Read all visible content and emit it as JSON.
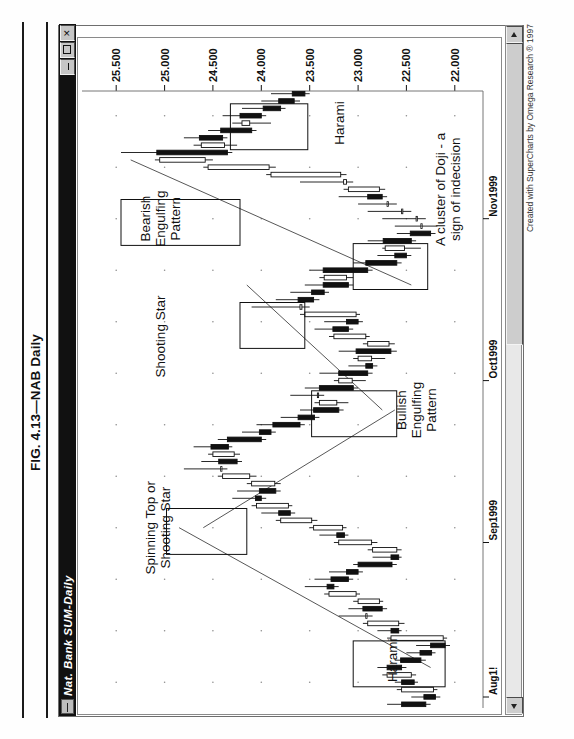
{
  "figure": {
    "caption": "FIG. 4.13—NAB Daily"
  },
  "window": {
    "title": "Nat. Bank  SUM-Daily",
    "icon": "chart-window-icon",
    "buttons": [
      {
        "name": "minimize-button",
        "glyph": "_"
      },
      {
        "name": "maximize-button",
        "glyph": "□"
      },
      {
        "name": "close-button",
        "glyph": "X"
      }
    ],
    "credit": "Created with SuperCharts by Omega Research ® 1997"
  },
  "scrollbar": {
    "left_arrow": "◀",
    "right_arrow": "▶",
    "thumb_label": ""
  },
  "chart_data": {
    "type": "candlestick",
    "title": "Nat. Bank  SUM-Daily",
    "xlabel": "",
    "ylabel": "",
    "grid": true,
    "legend": "none",
    "ylim": [
      21.75,
      25.75
    ],
    "price_ticks": [
      "25.500",
      "25.000",
      "24.500",
      "24.000",
      "23.500",
      "23.000",
      "22.500",
      "22.000"
    ],
    "price_tick_values": [
      25.5,
      25.0,
      24.5,
      24.0,
      23.5,
      23.0,
      22.5,
      22.0
    ],
    "date_ticks": [
      "Aug1!",
      "Sep1999",
      "Oct1999",
      "Nov1999"
    ],
    "date_tick_index": [
      1,
      22,
      44,
      66
    ],
    "n_bars": 84,
    "columns": [
      "open",
      "high",
      "low",
      "close"
    ],
    "bars": [
      [
        22.55,
        22.7,
        22.25,
        22.3
      ],
      [
        22.32,
        22.45,
        22.15,
        22.2
      ],
      [
        22.22,
        22.6,
        22.18,
        22.55
      ],
      [
        22.55,
        22.62,
        22.38,
        22.42
      ],
      [
        22.45,
        22.75,
        22.4,
        22.7
      ],
      [
        22.7,
        22.8,
        22.5,
        22.55
      ],
      [
        22.56,
        22.62,
        22.3,
        22.35
      ],
      [
        22.36,
        22.5,
        22.2,
        22.24
      ],
      [
        22.25,
        22.4,
        22.05,
        22.1
      ],
      [
        22.12,
        22.7,
        22.08,
        22.66
      ],
      [
        22.66,
        22.8,
        22.55,
        22.58
      ],
      [
        22.58,
        22.95,
        22.52,
        22.9
      ],
      [
        22.92,
        23.2,
        22.85,
        22.92
      ],
      [
        22.95,
        23.1,
        22.7,
        22.75
      ],
      [
        22.78,
        23.05,
        22.74,
        23.0
      ],
      [
        23.02,
        23.35,
        22.98,
        23.3
      ],
      [
        23.32,
        23.55,
        23.2,
        23.25
      ],
      [
        23.28,
        23.45,
        23.05,
        23.1
      ],
      [
        23.12,
        23.3,
        22.95,
        23.0
      ],
      [
        23.0,
        23.05,
        22.6,
        22.65
      ],
      [
        22.66,
        22.85,
        22.55,
        22.58
      ],
      [
        22.6,
        22.9,
        22.55,
        22.85
      ],
      [
        22.86,
        23.25,
        22.8,
        23.2
      ],
      [
        23.22,
        23.4,
        23.1,
        23.14
      ],
      [
        23.16,
        23.5,
        23.12,
        23.46
      ],
      [
        23.48,
        23.85,
        23.42,
        23.8
      ],
      [
        23.82,
        24.0,
        23.65,
        23.7
      ],
      [
        23.72,
        24.1,
        23.68,
        24.05
      ],
      [
        24.06,
        24.3,
        23.95,
        24.0
      ],
      [
        24.02,
        24.25,
        23.8,
        23.85
      ],
      [
        23.86,
        24.15,
        23.8,
        24.1
      ],
      [
        24.12,
        24.45,
        24.05,
        24.4
      ],
      [
        24.42,
        24.8,
        24.35,
        24.42
      ],
      [
        24.44,
        24.62,
        24.2,
        24.25
      ],
      [
        24.28,
        24.55,
        24.22,
        24.5
      ],
      [
        24.52,
        24.7,
        24.3,
        24.34
      ],
      [
        24.35,
        24.45,
        23.95,
        24.0
      ],
      [
        24.02,
        24.2,
        23.85,
        23.9
      ],
      [
        23.88,
        24.05,
        23.55,
        23.6
      ],
      [
        23.62,
        23.8,
        23.4,
        23.45
      ],
      [
        23.46,
        23.6,
        23.15,
        23.2
      ],
      [
        23.22,
        23.45,
        23.1,
        23.4
      ],
      [
        23.42,
        23.7,
        23.35,
        23.42
      ],
      [
        23.4,
        23.55,
        23.0,
        23.05
      ],
      [
        23.06,
        23.25,
        22.92,
        23.2
      ],
      [
        23.2,
        23.4,
        22.85,
        22.9
      ],
      [
        22.92,
        23.1,
        22.8,
        22.85
      ],
      [
        22.86,
        23.05,
        22.72,
        23.0
      ],
      [
        23.02,
        23.2,
        22.6,
        22.66
      ],
      [
        22.68,
        22.95,
        22.62,
        22.9
      ],
      [
        22.92,
        23.3,
        22.88,
        23.25
      ],
      [
        23.26,
        23.45,
        23.05,
        23.1
      ],
      [
        23.12,
        23.35,
        22.95,
        23.0
      ],
      [
        23.02,
        23.6,
        22.98,
        23.55
      ],
      [
        23.58,
        24.1,
        23.5,
        23.6
      ],
      [
        23.62,
        23.85,
        23.4,
        23.46
      ],
      [
        23.48,
        23.7,
        23.3,
        23.35
      ],
      [
        23.36,
        23.55,
        23.05,
        23.1
      ],
      [
        23.12,
        23.4,
        23.05,
        23.35
      ],
      [
        23.36,
        23.5,
        22.85,
        22.9
      ],
      [
        22.92,
        23.05,
        22.55,
        22.6
      ],
      [
        22.62,
        22.8,
        22.45,
        22.5
      ],
      [
        22.52,
        22.75,
        22.35,
        22.72
      ],
      [
        22.74,
        22.9,
        22.4,
        22.45
      ],
      [
        22.46,
        22.6,
        22.2,
        22.25
      ],
      [
        22.35,
        22.62,
        22.18,
        22.35
      ],
      [
        22.4,
        22.75,
        22.3,
        22.4
      ],
      [
        22.55,
        22.9,
        22.45,
        22.55
      ],
      [
        22.7,
        23.0,
        22.6,
        22.7
      ],
      [
        22.9,
        23.2,
        22.7,
        22.75
      ],
      [
        22.78,
        23.15,
        22.72,
        23.1
      ],
      [
        23.12,
        23.6,
        23.05,
        23.15
      ],
      [
        23.18,
        23.95,
        23.12,
        23.9
      ],
      [
        23.92,
        24.6,
        23.85,
        24.55
      ],
      [
        24.58,
        25.1,
        24.5,
        25.05
      ],
      [
        25.08,
        25.45,
        24.3,
        24.35
      ],
      [
        24.38,
        24.7,
        24.25,
        24.62
      ],
      [
        24.64,
        24.8,
        24.35,
        24.4
      ],
      [
        24.42,
        24.55,
        24.05,
        24.1
      ],
      [
        24.12,
        24.3,
        23.9,
        24.2
      ],
      [
        24.22,
        24.4,
        23.95,
        24.0
      ],
      [
        23.98,
        24.2,
        23.75,
        23.8
      ],
      [
        23.82,
        24.0,
        23.6,
        23.66
      ],
      [
        23.68,
        23.9,
        23.5,
        23.55
      ]
    ],
    "annotations": [
      {
        "name": "harami-left",
        "text": "Harami",
        "x_bar": 6,
        "y_price": 22.6
      },
      {
        "name": "spinning-top-or-shooting-star",
        "text": "Spinning Top or\nShooting Star",
        "x_bar": 24,
        "y_price": 25.1
      },
      {
        "name": "bullish-engulfing-pattern",
        "text": "Bullish\nEngulfing\nPattern",
        "x_bar": 40,
        "y_price": 22.5
      },
      {
        "name": "shooting-star",
        "text": "Shooting Star",
        "x_bar": 50,
        "y_price": 25.0
      },
      {
        "name": "bearish-engulfing-pattern",
        "text": "Bearish\nEngulfing\nPattern",
        "x_bar": 66,
        "y_price": 25.15
      },
      {
        "name": "doji-cluster",
        "text": "A cluster of Doji - a\nsign of indecision",
        "x_bar": 70,
        "y_price": 22.1
      },
      {
        "name": "harami-right",
        "text": "Harami",
        "x_bar": 79,
        "y_price": 23.15
      }
    ],
    "highlight_boxes": [
      {
        "name": "harami-left-box",
        "x0": 3,
        "x1": 8,
        "y0": 22.1,
        "y1": 23.05
      },
      {
        "name": "spinning-top-box",
        "x0": 21,
        "x1": 26,
        "y0": 24.15,
        "y1": 24.98
      },
      {
        "name": "bullish-engulfing-box",
        "x0": 37,
        "x1": 42,
        "y0": 22.6,
        "y1": 23.48
      },
      {
        "name": "shooting-star-box",
        "x0": 49,
        "x1": 54,
        "y0": 23.55,
        "y1": 24.22
      },
      {
        "name": "bearish-engulfing-box",
        "x0": 63,
        "x1": 68,
        "y0": 24.22,
        "y1": 25.45
      },
      {
        "name": "doji-cluster-box",
        "x0": 57,
        "x1": 62,
        "y0": 22.28,
        "y1": 23.05
      },
      {
        "name": "harami-right-box",
        "x0": 76,
        "x1": 81,
        "y0": 23.52,
        "y1": 24.32
      }
    ],
    "trendlines": [
      {
        "name": "trendline-1",
        "x0": 5,
        "y0": 22.25,
        "x1": 24,
        "y1": 24.85
      },
      {
        "name": "trendline-2",
        "x0": 24,
        "y0": 24.6,
        "x1": 40,
        "y1": 22.62
      },
      {
        "name": "trendline-3",
        "x0": 40,
        "y0": 22.75,
        "x1": 57,
        "y1": 24.15
      },
      {
        "name": "trendline-4",
        "x0": 57,
        "y0": 22.45,
        "x1": 74,
        "y1": 25.35
      }
    ]
  }
}
